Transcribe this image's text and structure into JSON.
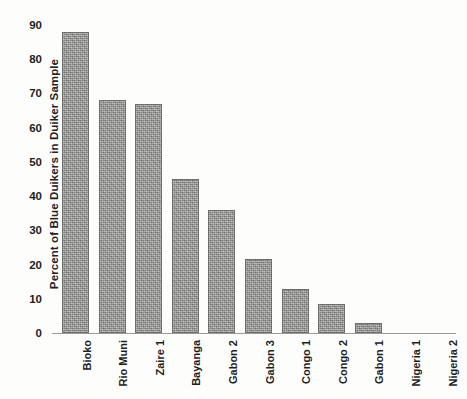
{
  "chart_data": {
    "type": "bar",
    "title": "",
    "xlabel": "",
    "ylabel": "Percent of Blue Duikers in  Duiker Sample",
    "ylim": [
      0,
      90
    ],
    "ytick_step": 10,
    "yticks": [
      90,
      80,
      70,
      60,
      50,
      40,
      30,
      20,
      10,
      0
    ],
    "grid": false,
    "legend": null,
    "bar_color": "#969692",
    "bar_edge_color": "#6e6e6a",
    "background_color": "#fdfdfb",
    "categories": [
      "Bioko",
      "Rio Muni",
      "Zaire 1",
      "Bayanga",
      "Gabon 2",
      "Gabon 3",
      "Congo 1",
      "Congo 2",
      "Gabon 1",
      "Nigeria 1",
      "Nigeria 2"
    ],
    "values": [
      88,
      68,
      67,
      45,
      36,
      21.5,
      13,
      8.5,
      2.8,
      0,
      0
    ]
  }
}
